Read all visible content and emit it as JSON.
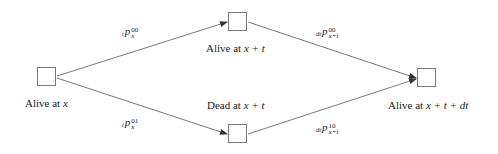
{
  "diagram": {
    "type": "state-transition",
    "nodes": [
      {
        "id": "n0",
        "label_prefix": "Alive at ",
        "label_var": "x"
      },
      {
        "id": "n1",
        "label_prefix": "Alive at ",
        "label_var": "x + t"
      },
      {
        "id": "n2",
        "label_prefix": "Dead at ",
        "label_var": "x + t"
      },
      {
        "id": "n3",
        "label_prefix": "Alive at ",
        "label_var": "x + t + dt"
      }
    ],
    "edges": [
      {
        "from": "n0",
        "to": "n1",
        "pre": "t",
        "base": "p",
        "sup": "00",
        "sub": "x"
      },
      {
        "from": "n0",
        "to": "n2",
        "pre": "t",
        "base": "p",
        "sup": "01",
        "sub": "x"
      },
      {
        "from": "n1",
        "to": "n3",
        "pre": "dt",
        "base": "p",
        "sup": "00",
        "sub": "x+t"
      },
      {
        "from": "n2",
        "to": "n3",
        "pre": "dt",
        "base": "p",
        "sup": "10",
        "sub": "x+t"
      }
    ],
    "colors": {
      "line": "#555555",
      "box": "#7a7a7a",
      "text": "#222222"
    }
  }
}
